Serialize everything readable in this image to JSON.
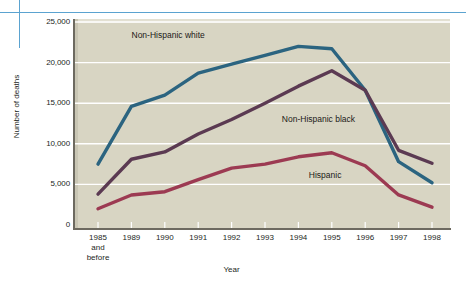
{
  "chart_data": {
    "type": "line",
    "title": "",
    "xlabel": "Year",
    "ylabel": "Number of deaths",
    "categories": [
      "1985 and before",
      "1989",
      "1990",
      "1991",
      "1992",
      "1993",
      "1994",
      "1995",
      "1996",
      "1997",
      "1998"
    ],
    "x_tick_labels": [
      {
        "line1": "1985",
        "line2": "and",
        "line3": "before"
      },
      {
        "line1": "1989",
        "line2": "",
        "line3": ""
      },
      {
        "line1": "1990",
        "line2": "",
        "line3": ""
      },
      {
        "line1": "1991",
        "line2": "",
        "line3": ""
      },
      {
        "line1": "1992",
        "line2": "",
        "line3": ""
      },
      {
        "line1": "1993",
        "line2": "",
        "line3": ""
      },
      {
        "line1": "1994",
        "line2": "",
        "line3": ""
      },
      {
        "line1": "1995",
        "line2": "",
        "line3": ""
      },
      {
        "line1": "1996",
        "line2": "",
        "line3": ""
      },
      {
        "line1": "1997",
        "line2": "",
        "line3": ""
      },
      {
        "line1": "1998",
        "line2": "",
        "line3": ""
      }
    ],
    "y_tick_labels": [
      "25,000",
      "20,000",
      "15,000",
      "10,000",
      "5,000",
      "0"
    ],
    "y_ticks": [
      25000,
      20000,
      15000,
      10000,
      5000,
      0
    ],
    "ylim": [
      0,
      25000
    ],
    "grid": true,
    "grid_color": "#ffffff",
    "plot_background": "#d8d5c3",
    "legend": "inline-annotations",
    "series": [
      {
        "name": "Non-Hispanic white",
        "color": "#2b6480",
        "values": [
          7500,
          14600,
          16000,
          18700,
          19800,
          20900,
          22000,
          21700,
          16600,
          7800,
          5200
        ],
        "label_x_index": 2.1,
        "label_y": 23400
      },
      {
        "name": "Non-Hispanic black",
        "color": "#5b3a52",
        "values": [
          3800,
          8100,
          9000,
          11200,
          13000,
          15000,
          17100,
          19000,
          16600,
          9200,
          7600
        ],
        "label_x_index": 6.6,
        "label_y": 13000
      },
      {
        "name": "Hispanic",
        "color": "#9c3a52",
        "values": [
          2000,
          3700,
          4100,
          5600,
          7000,
          7500,
          8400,
          8900,
          7300,
          3700,
          2200
        ],
        "label_x_index": 6.8,
        "label_y": 6200
      }
    ]
  },
  "decorations": {
    "horizontal_rule_color": "#5BA3D0",
    "vertical_rule_color": "#5BA3D0"
  }
}
